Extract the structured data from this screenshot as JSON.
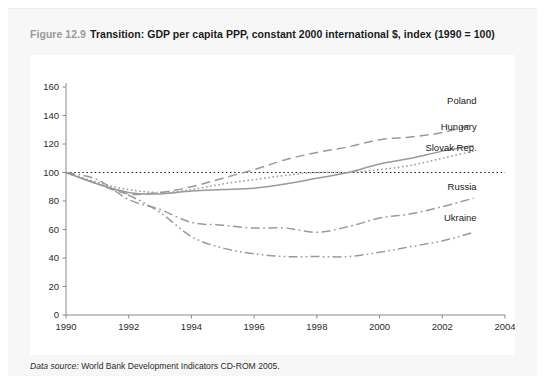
{
  "figure": {
    "number": "Figure 12.9",
    "title": "Transition: GDP per capita PPP, constant 2000 international $, index (1990 = 100)",
    "source_label": "Data source:",
    "source_text": "World Bank Development Indicators CD-ROM 2005."
  },
  "colors": {
    "card_background": "#f7f7f7",
    "plot_background": "#ffffff",
    "axis": "#8a8a8a",
    "line": "#9a9a9a",
    "reference_line": "#1b1b1b",
    "text": "#1b1b1b",
    "figure_number": "#9a9a9a"
  },
  "chart_data": {
    "type": "line",
    "title": "Transition: GDP per capita PPP, constant 2000 international $, index (1990 = 100)",
    "xlabel": "",
    "ylabel": "",
    "xlim": [
      1990,
      2004
    ],
    "ylim": [
      0,
      160
    ],
    "xticks": [
      1990,
      1992,
      1994,
      1996,
      1998,
      2000,
      2002,
      2004
    ],
    "yticks": [
      0,
      20,
      40,
      60,
      80,
      100,
      120,
      140,
      160
    ],
    "grid": false,
    "legend": "inline-right-labels",
    "reference_line": {
      "y": 100,
      "style": "dotted",
      "label": "index base (1990 = 100)"
    },
    "x": [
      1990,
      1991,
      1992,
      1993,
      1994,
      1995,
      1996,
      1997,
      1998,
      1999,
      2000,
      2001,
      2002,
      2003
    ],
    "series": [
      {
        "name": "Poland",
        "style": "dashed",
        "label_x": 2003,
        "label_y": 148,
        "values": [
          100,
          92,
          85,
          86,
          90,
          96,
          102,
          109,
          114,
          118,
          123,
          125,
          128,
          134
        ]
      },
      {
        "name": "Hungary",
        "style": "solid",
        "label_x": 2003,
        "label_y": 130,
        "values": [
          100,
          92,
          86,
          85,
          87,
          88,
          89,
          92,
          96,
          100,
          106,
          110,
          115,
          119
        ]
      },
      {
        "name": "Slovak Rep.",
        "style": "dotted",
        "label_x": 2003,
        "label_y": 115,
        "values": [
          100,
          93,
          88,
          86,
          88,
          92,
          95,
          98,
          100,
          100,
          102,
          105,
          110,
          115
        ]
      },
      {
        "name": "Russia",
        "style": "dash-dot",
        "label_x": 2003,
        "label_y": 88,
        "values": [
          100,
          95,
          81,
          74,
          65,
          63,
          61,
          61,
          58,
          62,
          68,
          71,
          76,
          82
        ]
      },
      {
        "name": "Ukraine",
        "style": "dash-dot-dot",
        "label_x": 2003,
        "label_y": 66,
        "values": [
          100,
          92,
          84,
          72,
          55,
          47,
          43,
          41,
          41,
          41,
          44,
          48,
          52,
          58
        ]
      }
    ]
  }
}
